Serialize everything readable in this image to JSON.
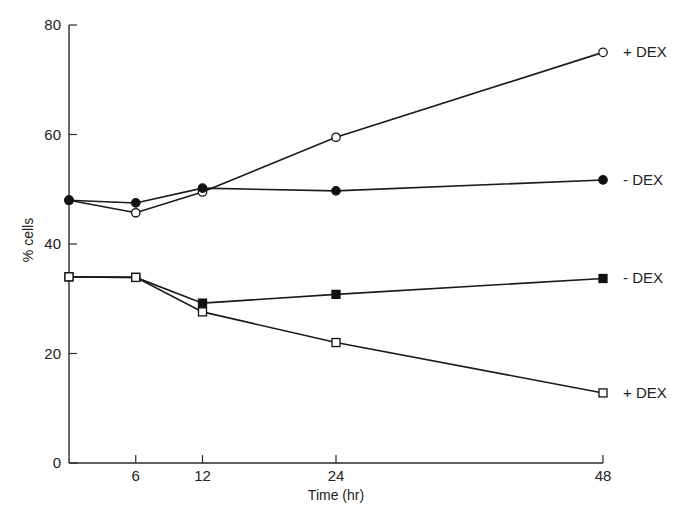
{
  "chart_data": {
    "type": "line",
    "title": "",
    "xlabel": "Time (hr)",
    "ylabel": "% cells",
    "xlim": [
      0,
      48
    ],
    "ylim": [
      0,
      80
    ],
    "x_ticks": [
      6,
      12,
      24,
      48
    ],
    "y_ticks": [
      0,
      20,
      40,
      60,
      80
    ],
    "grid": false,
    "legend_position": "inline-right",
    "x": [
      0,
      6,
      12,
      24,
      48
    ],
    "series": [
      {
        "name": "+ DEX (circles)",
        "label": "+ DEX",
        "marker": "open-circle",
        "values": [
          48,
          45.7,
          49.5,
          59.5,
          75
        ]
      },
      {
        "name": "- DEX (circles)",
        "label": "- DEX",
        "marker": "filled-circle",
        "values": [
          48,
          47.5,
          50.2,
          49.7,
          51.7
        ]
      },
      {
        "name": "- DEX (squares)",
        "label": "- DEX",
        "marker": "filled-square",
        "values": [
          34,
          33.9,
          29.2,
          30.8,
          33.7
        ]
      },
      {
        "name": "+ DEX (squares)",
        "label": "+ DEX",
        "marker": "open-square",
        "values": [
          34,
          33.9,
          27.6,
          22,
          12.8
        ]
      }
    ]
  },
  "colors": {
    "line": "#1a1a1a",
    "axis": "#2a2a2a",
    "text": "#222222",
    "background": "#ffffff"
  }
}
